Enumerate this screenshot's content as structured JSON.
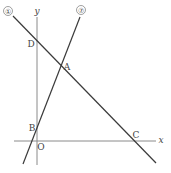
{
  "diagram": {
    "type": "coordinate-geometry",
    "axes": {
      "x_label": "x",
      "y_label": "y",
      "origin_label": "O"
    },
    "lines": [
      {
        "id": "line-a",
        "label": "⑦",
        "passes_through": [
          "B",
          "A"
        ]
      },
      {
        "id": "line-i",
        "label": "①",
        "passes_through": [
          "D",
          "A",
          "C"
        ]
      }
    ],
    "points": {
      "A": "A",
      "B": "B",
      "C": "C",
      "D": "D"
    },
    "colors": {
      "line": "#3a3a3a",
      "axis": "#8a8a8a",
      "text": "#444444"
    }
  }
}
